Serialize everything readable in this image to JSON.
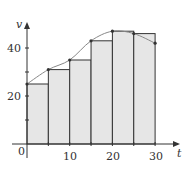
{
  "chart_data": {
    "type": "bar",
    "subtype": "left-endpoint Riemann sum with curve",
    "title": "",
    "xlabel": "t",
    "ylabel": "v",
    "xlim": [
      0,
      30
    ],
    "ylim": [
      0,
      50
    ],
    "x_ticks": [
      0,
      10,
      20,
      30
    ],
    "x_minor_ticks": [
      5,
      15,
      25
    ],
    "y_ticks": [
      20,
      40
    ],
    "y_minor_ticks": [
      10,
      30
    ],
    "grid": false,
    "legend": null,
    "bar_width": 5,
    "categories": [
      0,
      5,
      10,
      15,
      20,
      25
    ],
    "values": [
      25,
      31,
      35,
      43,
      47,
      46
    ],
    "curve": {
      "x": [
        0,
        5,
        10,
        15,
        20,
        25,
        30
      ],
      "y": [
        25,
        31,
        35,
        43,
        47,
        46,
        42
      ]
    },
    "colors": {
      "bar_fill": "#e6e6e6",
      "bar_stroke": "#333333",
      "curve": "#888888",
      "axis": "#333333"
    }
  },
  "labels": {
    "x_axis": "t",
    "y_axis": "v",
    "origin": "0",
    "x10": "10",
    "x20": "20",
    "x30": "30",
    "y20": "20",
    "y40": "40"
  }
}
